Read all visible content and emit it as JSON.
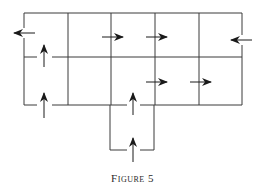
{
  "caption": "Figure 5",
  "colors": {
    "line": "#3a3a3a",
    "arrow": "#1a1a1a",
    "background": "#ffffff"
  },
  "grid": {
    "columns_x": [
      24,
      68,
      111,
      155,
      199,
      242
    ],
    "rows_y": [
      13,
      57,
      105
    ],
    "extension_box": {
      "x1": 110,
      "x2": 154,
      "y1": 105,
      "y2": 150
    }
  },
  "arrows": [
    {
      "id": "a1",
      "x": 24,
      "y": 33,
      "direction": "left"
    },
    {
      "id": "a2",
      "x": 111,
      "y": 37,
      "direction": "right"
    },
    {
      "id": "a3",
      "x": 155,
      "y": 37,
      "direction": "right"
    },
    {
      "id": "a4",
      "x": 242,
      "y": 40,
      "direction": "left"
    },
    {
      "id": "a5",
      "x": 44,
      "y": 57,
      "direction": "up"
    },
    {
      "id": "a6",
      "x": 155,
      "y": 82,
      "direction": "right"
    },
    {
      "id": "a7",
      "x": 199,
      "y": 82,
      "direction": "right"
    },
    {
      "id": "a8",
      "x": 44,
      "y": 105,
      "direction": "up"
    },
    {
      "id": "a9",
      "x": 133,
      "y": 105,
      "direction": "up"
    },
    {
      "id": "a10",
      "x": 133,
      "y": 150,
      "direction": "up"
    }
  ]
}
